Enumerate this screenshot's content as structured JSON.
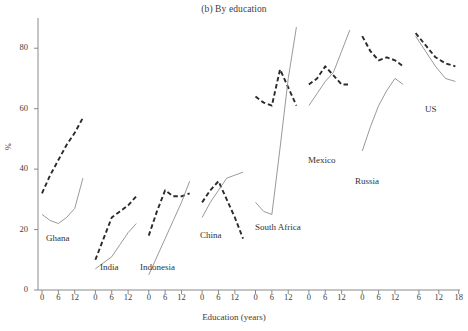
{
  "chart_data": {
    "type": "line",
    "title": "(b) By education",
    "xlabel": "Education (years)",
    "ylabel": "%",
    "ylim": [
      0,
      90
    ],
    "yticks": [
      0,
      20,
      40,
      60,
      80
    ],
    "grid": false,
    "legend": "none",
    "panel_layout": "eight side-by-side country panels sharing one y-axis",
    "series_styles": {
      "dashed": "dashed black line",
      "solid": "thin solid gray line"
    },
    "panels": [
      {
        "country": "Ghana",
        "xticks": [
          0,
          6,
          12
        ],
        "xrange": [
          0,
          17
        ],
        "series": [
          {
            "name": "dashed",
            "style": "dashed",
            "x": [
              0,
              3,
              6,
              9,
              12,
              15
            ],
            "y": [
              32,
              38,
              43,
              48,
              52,
              57
            ]
          },
          {
            "name": "solid",
            "style": "solid",
            "x": [
              0,
              3,
              6,
              9,
              12,
              15
            ],
            "y": [
              25,
              23,
              22,
              24,
              27,
              37
            ]
          }
        ]
      },
      {
        "country": "India",
        "xticks": [
          0,
          6,
          12
        ],
        "xrange": [
          0,
          17
        ],
        "series": [
          {
            "name": "dashed",
            "style": "dashed",
            "x": [
              0,
              3,
              6,
              9,
              12,
              15
            ],
            "y": [
              10,
              17,
              24,
              26,
              28,
              31
            ]
          },
          {
            "name": "solid",
            "style": "solid",
            "x": [
              0,
              3,
              6,
              9,
              12,
              15
            ],
            "y": [
              7,
              9,
              11,
              15,
              19,
              22
            ]
          }
        ]
      },
      {
        "country": "Indonesia",
        "xticks": [
          0,
          6,
          12
        ],
        "xrange": [
          0,
          17
        ],
        "series": [
          {
            "name": "dashed",
            "style": "dashed",
            "x": [
              0,
              3,
              6,
              9,
              12,
              15
            ],
            "y": [
              18,
              26,
              33,
              31,
              31,
              32
            ]
          },
          {
            "name": "solid",
            "style": "solid",
            "x": [
              0,
              3,
              6,
              9,
              12,
              15
            ],
            "y": [
              5,
              11,
              17,
              23,
              29,
              36
            ]
          }
        ]
      },
      {
        "country": "China",
        "xticks": [
          0,
          6,
          12
        ],
        "xrange": [
          0,
          17
        ],
        "series": [
          {
            "name": "dashed",
            "style": "dashed",
            "x": [
              0,
              3,
              6,
              9,
              12,
              15
            ],
            "y": [
              29,
              33,
              36,
              30,
              24,
              17
            ]
          },
          {
            "name": "solid",
            "style": "solid",
            "x": [
              0,
              3,
              6,
              9,
              12,
              15
            ],
            "y": [
              24,
              29,
              33,
              37,
              38,
              39
            ]
          }
        ]
      },
      {
        "country": "South Africa",
        "xticks": [
          0,
          6,
          12
        ],
        "xrange": [
          0,
          17
        ],
        "series": [
          {
            "name": "dashed",
            "style": "dashed",
            "x": [
              0,
              3,
              6,
              9,
              12,
              15
            ],
            "y": [
              64,
              62,
              61,
              73,
              67,
              61
            ]
          },
          {
            "name": "solid",
            "style": "solid",
            "x": [
              0,
              3,
              6,
              9,
              12,
              15
            ],
            "y": [
              29,
              26,
              25,
              47,
              70,
              87
            ]
          }
        ]
      },
      {
        "country": "Mexico",
        "xticks": [
          0,
          6,
          12
        ],
        "xrange": [
          0,
          17
        ],
        "series": [
          {
            "name": "dashed",
            "style": "dashed",
            "x": [
              0,
              3,
              6,
              9,
              12,
              15
            ],
            "y": [
              68,
              70,
              74,
              71,
              68,
              68
            ]
          },
          {
            "name": "solid",
            "style": "solid",
            "x": [
              0,
              3,
              6,
              9,
              12,
              15
            ],
            "y": [
              61,
              65,
              69,
              72,
              79,
              86
            ]
          }
        ]
      },
      {
        "country": "Russia",
        "xticks": [
          0,
          6,
          12
        ],
        "xrange": [
          0,
          17
        ],
        "series": [
          {
            "name": "dashed",
            "style": "dashed",
            "x": [
              0,
              3,
              6,
              9,
              12,
              15
            ],
            "y": [
              84,
              79,
              76,
              77,
              76,
              74
            ]
          },
          {
            "name": "solid",
            "style": "solid",
            "x": [
              0,
              3,
              6,
              9,
              12,
              15
            ],
            "y": [
              46,
              54,
              61,
              66,
              70,
              68
            ]
          }
        ]
      },
      {
        "country": "US",
        "xticks": [
          6,
          12,
          18
        ],
        "xrange": [
          5,
          19
        ],
        "series": [
          {
            "name": "dashed",
            "style": "dashed",
            "x": [
              5,
              8,
              11,
              14,
              17
            ],
            "y": [
              85,
              81,
              77,
              75,
              74
            ]
          },
          {
            "name": "solid",
            "style": "solid",
            "x": [
              5,
              8,
              11,
              14,
              17
            ],
            "y": [
              84,
              79,
              74,
              70,
              69
            ]
          }
        ]
      }
    ],
    "country_labels": [
      {
        "text": "Ghana",
        "x": 46,
        "y": 233
      },
      {
        "text": "India",
        "x": 100,
        "y": 262
      },
      {
        "text": "Indonesia",
        "x": 140,
        "y": 262
      },
      {
        "text": "China",
        "x": 200,
        "y": 230
      },
      {
        "text": "South Africa",
        "x": 255,
        "y": 222
      },
      {
        "text": "Mexico",
        "x": 308,
        "y": 155
      },
      {
        "text": "Russia",
        "x": 355,
        "y": 176
      },
      {
        "text": "US",
        "x": 425,
        "y": 104
      }
    ]
  },
  "colors": {
    "axis": "#8a8a8a",
    "dashed_line": "#2b2b2b",
    "solid_line": "#8d8d8d",
    "text": "#3a3a3a",
    "background": "#ffffff"
  }
}
